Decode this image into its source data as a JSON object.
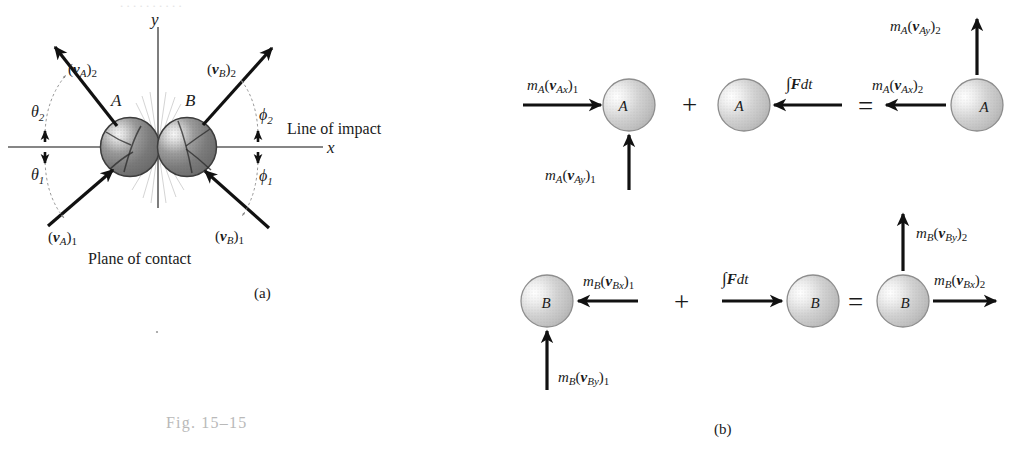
{
  "figure": {
    "caption_number": "Fig. 15–15",
    "panel_a_label": "(a)",
    "panel_b_label": "(b)"
  },
  "panel_a": {
    "title_axis_y": "y",
    "title_axis_x": "x",
    "line_of_impact_label": "Line of impact",
    "plane_of_contact_label": "Plane of contact",
    "body_a_label": "A",
    "body_b_label": "B",
    "vectors": [
      {
        "name": "vA2",
        "label_m": "(",
        "label": "(v",
        "sub": "A",
        "post": ")",
        "idx": "2",
        "direction": "up-left"
      },
      {
        "name": "vA1",
        "label": "(v",
        "sub": "A",
        "post": ")",
        "idx": "1",
        "direction": "up-right-incoming"
      },
      {
        "name": "vB2",
        "label": "(v",
        "sub": "B",
        "post": ")",
        "idx": "2",
        "direction": "up-right"
      },
      {
        "name": "vB1",
        "label": "(v",
        "sub": "B",
        "post": ")",
        "idx": "1",
        "direction": "up-left-incoming"
      }
    ],
    "angles": [
      {
        "name": "theta2",
        "symbol": "θ",
        "index": "2"
      },
      {
        "name": "theta1",
        "symbol": "θ",
        "index": "1"
      },
      {
        "name": "phi2",
        "symbol": "ϕ",
        "index": "2"
      },
      {
        "name": "phi1",
        "symbol": "ϕ",
        "index": "1"
      }
    ]
  },
  "panel_b": {
    "operators": {
      "plus": "+",
      "equals": "="
    },
    "impulse_label": {
      "integral": "∫",
      "force": "F",
      "dt": "dt"
    },
    "row_a": {
      "body_label": "A",
      "terms": [
        {
          "name": "mA-vAx-1",
          "m": "m",
          "msub": "A",
          "open": "(",
          "v": "v",
          "vsub": "Ax",
          "close": ")",
          "idx": "1",
          "arrow": "right"
        },
        {
          "name": "mA-vAy-1",
          "m": "m",
          "msub": "A",
          "open": "(",
          "v": "v",
          "vsub": "Ay",
          "close": ")",
          "idx": "1",
          "arrow": "up"
        },
        {
          "name": "impulse-a",
          "arrow": "left"
        },
        {
          "name": "mA-vAx-2",
          "m": "m",
          "msub": "A",
          "open": "(",
          "v": "v",
          "vsub": "Ax",
          "close": ")",
          "idx": "2",
          "arrow": "left"
        },
        {
          "name": "mA-vAy-2",
          "m": "m",
          "msub": "A",
          "open": "(",
          "v": "v",
          "vsub": "Ay",
          "close": ")",
          "idx": "2",
          "arrow": "up"
        }
      ]
    },
    "row_b": {
      "body_label": "B",
      "terms": [
        {
          "name": "mB-vBx-1",
          "m": "m",
          "msub": "B",
          "open": "(",
          "v": "v",
          "vsub": "Bx",
          "close": ")",
          "idx": "1",
          "arrow": "left"
        },
        {
          "name": "mB-vBy-1",
          "m": "m",
          "msub": "B",
          "open": "(",
          "v": "v",
          "vsub": "By",
          "close": ")",
          "idx": "1",
          "arrow": "up"
        },
        {
          "name": "impulse-b",
          "arrow": "right"
        },
        {
          "name": "mB-vBx-2",
          "m": "m",
          "msub": "B",
          "open": "(",
          "v": "v",
          "vsub": "Bx",
          "close": ")",
          "idx": "2",
          "arrow": "right"
        },
        {
          "name": "mB-vBy-2",
          "m": "m",
          "msub": "B",
          "open": "(",
          "v": "v",
          "vsub": "By",
          "close": ")",
          "idx": "2",
          "arrow": "up"
        }
      ]
    }
  },
  "colors": {
    "ink": "#1a1a1a",
    "axis": "#5e5e5e",
    "caption": "#b9b9b9",
    "sphere_dark_edge": "#4a4a4a",
    "sphere_light": "#f2f2f2"
  }
}
